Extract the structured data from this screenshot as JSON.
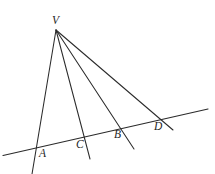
{
  "figure": {
    "kind": "euclidean-geometry-line-figure",
    "background_color": "#ffffff",
    "stroke_color": "#2b2b2b",
    "label_color": "#1f1f1f",
    "width": 215,
    "height": 174,
    "vertex": {
      "name": "V",
      "label": "V",
      "x": 56,
      "y": 30,
      "label_x": 52,
      "label_y": 24
    },
    "transversal": {
      "name": "transversal-line",
      "x1": 3,
      "y1": 155.5,
      "x2": 208,
      "y2": 109
    },
    "rays": [
      {
        "name": "ray-V-A",
        "through": "A",
        "x1": 56,
        "y1": 30,
        "x2": 32,
        "y2": 174
      },
      {
        "name": "ray-V-C",
        "through": "C",
        "x1": 56,
        "y1": 30,
        "x2": 90,
        "y2": 159
      },
      {
        "name": "ray-V-B",
        "through": "B",
        "x1": 56,
        "y1": 30,
        "x2": 134,
        "y2": 149
      },
      {
        "name": "ray-V-D",
        "through": "D",
        "x1": 56,
        "y1": 30,
        "x2": 173,
        "y2": 130
      }
    ],
    "points": [
      {
        "name": "point-A",
        "label": "A",
        "x": 35,
        "y": 147,
        "label_x": 39,
        "label_y": 157
      },
      {
        "name": "point-C",
        "label": "C",
        "x": 84,
        "y": 138,
        "label_x": 76,
        "label_y": 148
      },
      {
        "name": "point-B",
        "label": "B",
        "x": 120,
        "y": 129,
        "label_x": 114,
        "label_y": 138
      },
      {
        "name": "point-D",
        "label": "D",
        "x": 161,
        "y": 120,
        "label_x": 154,
        "label_y": 130
      }
    ]
  }
}
